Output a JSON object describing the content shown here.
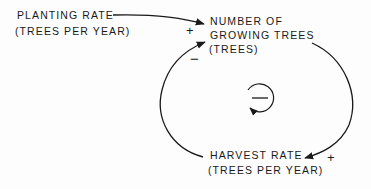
{
  "diagram": {
    "type": "causal-loop",
    "nodes": {
      "planting_rate": {
        "line1": "PLANTING RATE",
        "line2": "(TREES PER YEAR)"
      },
      "growing_trees": {
        "line1": "NUMBER OF",
        "line2": "GROWING TREES",
        "line3": "(TREES)"
      },
      "harvest_rate": {
        "line1": "HARVEST RATE",
        "line2": "(TREES PER YEAR)"
      }
    },
    "links": [
      {
        "from": "PLANTING RATE",
        "to": "NUMBER OF GROWING TREES",
        "polarity": "+"
      },
      {
        "from": "NUMBER OF GROWING TREES",
        "to": "HARVEST RATE",
        "polarity": "+"
      },
      {
        "from": "HARVEST RATE",
        "to": "NUMBER OF GROWING TREES",
        "polarity": "−"
      }
    ],
    "loop": {
      "polarity": "−",
      "type": "balancing",
      "icon": "counterclockwise-loop-icon"
    },
    "colors": {
      "ink": "#1a1a1a",
      "background": "#fdfdfd"
    }
  }
}
